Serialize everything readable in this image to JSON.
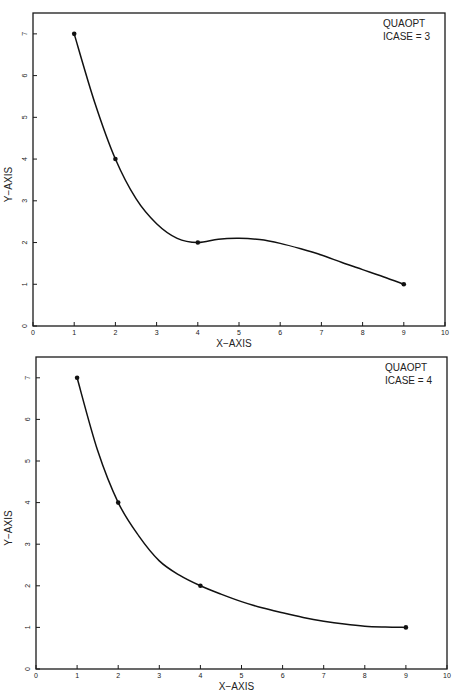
{
  "chart_data": [
    {
      "type": "line",
      "title": "",
      "annotation": [
        "QUAOPT",
        "ICASE = 3"
      ],
      "xlabel": "X-AXIS",
      "ylabel": "Y-AXIS",
      "xlim": [
        0,
        10
      ],
      "ylim": [
        0,
        7.5
      ],
      "xticks": [
        "0",
        "1",
        "2",
        "3",
        "4",
        "5",
        "6",
        "7",
        "8",
        "9",
        "10"
      ],
      "yticks": [
        "0",
        "1",
        "2",
        "3",
        "4",
        "5",
        "6",
        "7"
      ],
      "grid": false,
      "points": {
        "x": [
          1,
          2,
          4,
          9
        ],
        "y": [
          7,
          4,
          2,
          1
        ]
      },
      "curve": {
        "x": [
          1,
          1.5,
          2,
          2.5,
          3,
          3.5,
          4,
          4.5,
          5,
          5.5,
          6,
          6.5,
          7,
          7.5,
          8,
          8.5,
          9
        ],
        "y": [
          7,
          5.35,
          4,
          3.05,
          2.45,
          2.1,
          2.0,
          2.08,
          2.1,
          2.07,
          1.98,
          1.85,
          1.7,
          1.52,
          1.35,
          1.18,
          1.0
        ]
      }
    },
    {
      "type": "line",
      "title": "",
      "annotation": [
        "QUAOPT",
        "ICASE = 4"
      ],
      "xlabel": "X-AXIS",
      "ylabel": "Y-AXIS",
      "xlim": [
        0,
        10
      ],
      "ylim": [
        0,
        7.5
      ],
      "xticks": [
        "0",
        "1",
        "2",
        "3",
        "4",
        "5",
        "6",
        "7",
        "8",
        "9",
        "10"
      ],
      "yticks": [
        "0",
        "1",
        "2",
        "3",
        "4",
        "5",
        "6",
        "7"
      ],
      "grid": false,
      "points": {
        "x": [
          1,
          2,
          4,
          9
        ],
        "y": [
          7,
          4,
          2,
          1
        ]
      },
      "curve": {
        "x": [
          1,
          1.5,
          2,
          2.5,
          3,
          3.5,
          4,
          4.5,
          5,
          5.5,
          6,
          6.5,
          7,
          7.5,
          8,
          8.5,
          9
        ],
        "y": [
          7,
          5.25,
          4,
          3.2,
          2.6,
          2.25,
          2.0,
          1.8,
          1.62,
          1.47,
          1.35,
          1.24,
          1.15,
          1.08,
          1.03,
          1.01,
          1.0
        ]
      }
    }
  ]
}
